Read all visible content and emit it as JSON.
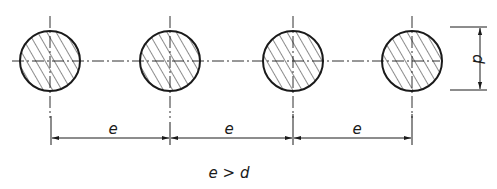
{
  "diagram": {
    "type": "technical-drawing",
    "colors": {
      "line": "#1a1a1a",
      "background": "#ffffff"
    },
    "circles": [
      {
        "id": 1,
        "cx": 50,
        "cy": 61,
        "r": 30
      },
      {
        "id": 2,
        "cx": 170,
        "cy": 61,
        "r": 30
      },
      {
        "id": 3,
        "cx": 293,
        "cy": 61,
        "r": 30
      },
      {
        "id": 4,
        "cx": 412,
        "cy": 61,
        "r": 30
      }
    ],
    "spacing_dimensions": [
      {
        "label": "e",
        "from_x": 50,
        "to_x": 170
      },
      {
        "label": "e",
        "from_x": 170,
        "to_x": 293
      },
      {
        "label": "e",
        "from_x": 293,
        "to_x": 412
      }
    ],
    "diameter_dimension": {
      "label": "d"
    },
    "condition": "e > d"
  }
}
